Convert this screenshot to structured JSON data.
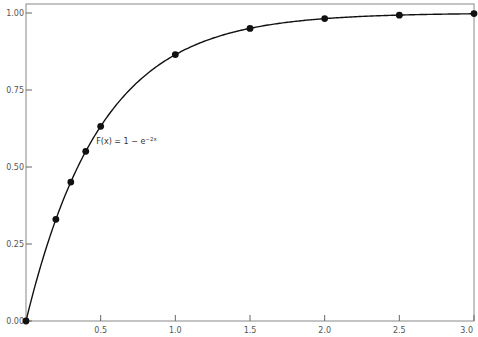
{
  "chart_data": {
    "type": "line",
    "title": "",
    "xlabel": "",
    "ylabel": "",
    "xlim": [
      0,
      3.0
    ],
    "ylim": [
      0,
      1.0
    ],
    "grid": false,
    "x_ticks": [
      "0.5",
      "1.0",
      "1.5",
      "2.0",
      "2.5",
      "3.0"
    ],
    "x_tick_values": [
      0.5,
      1.0,
      1.5,
      2.0,
      2.5,
      3.0
    ],
    "y_ticks": [
      "0.00",
      "0.25",
      "0.50",
      "0.75",
      "1.00"
    ],
    "y_tick_values": [
      0,
      0.25,
      0.5,
      0.75,
      1.0
    ],
    "annotation": {
      "text_main": "F(x) = 1 − e",
      "text_sup": "−2x",
      "x": 0.47,
      "y": 0.575
    },
    "series": [
      {
        "name": "F(x) = 1 - e^(-2x)",
        "marker": "circle",
        "color": "#111111",
        "x": [
          0,
          0.2,
          0.3,
          0.4,
          0.5,
          1.0,
          1.5,
          2.0,
          2.5,
          3.0
        ],
        "y": [
          0.0,
          0.33,
          0.451,
          0.551,
          0.632,
          0.865,
          0.95,
          0.982,
          0.993,
          0.998
        ]
      }
    ]
  }
}
